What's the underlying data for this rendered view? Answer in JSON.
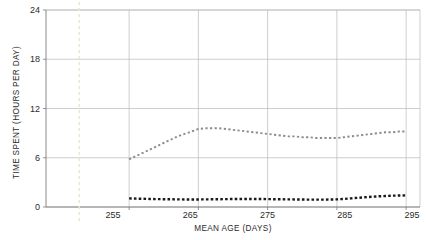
{
  "chart_data": {
    "type": "line",
    "title": "",
    "subtitle": "",
    "xlabel": "MEAN AGE (DAYS)",
    "ylabel": "TIME SPENT (HOURS PER DAY)",
    "xlim": [
      243,
      297
    ],
    "ylim": [
      0,
      24
    ],
    "xticks": [
      255,
      265,
      275,
      285,
      295
    ],
    "yticks": [
      0,
      6,
      12,
      18,
      24
    ],
    "grid": true,
    "legend": "none",
    "line_style": "dotted",
    "annotations": [
      {
        "name": "reference-line",
        "type": "vertical-dashed",
        "x": 247.8,
        "color": "#ece6c8"
      }
    ],
    "series": [
      {
        "name": "upper-series",
        "color": "#8c8c8c",
        "style": "dotted",
        "x": [
          255,
          256,
          257,
          258,
          259,
          260,
          261,
          262,
          263,
          264,
          265,
          266,
          267,
          268,
          269,
          270,
          271,
          272,
          273,
          274,
          275,
          276,
          277,
          278,
          279,
          280,
          281,
          282,
          283,
          284,
          285,
          286,
          287,
          288,
          289,
          290,
          291,
          292,
          293,
          294,
          295
        ],
        "values": [
          5.8,
          6.2,
          6.6,
          7.0,
          7.4,
          7.8,
          8.2,
          8.6,
          8.9,
          9.2,
          9.5,
          9.6,
          9.6,
          9.6,
          9.5,
          9.4,
          9.3,
          9.2,
          9.1,
          9.0,
          8.9,
          8.8,
          8.7,
          8.6,
          8.6,
          8.5,
          8.5,
          8.4,
          8.4,
          8.4,
          8.4,
          8.5,
          8.6,
          8.7,
          8.8,
          8.9,
          9.0,
          9.1,
          9.1,
          9.2,
          9.2
        ]
      },
      {
        "name": "lower-series",
        "color": "#1a1a1a",
        "style": "dotted",
        "x": [
          255,
          256,
          257,
          258,
          259,
          260,
          261,
          262,
          263,
          264,
          265,
          266,
          267,
          268,
          269,
          270,
          271,
          272,
          273,
          274,
          275,
          276,
          277,
          278,
          279,
          280,
          281,
          282,
          283,
          284,
          285,
          286,
          287,
          288,
          289,
          290,
          291,
          292,
          293,
          294,
          295
        ],
        "values": [
          1.05,
          1.02,
          1.0,
          0.98,
          0.96,
          0.95,
          0.94,
          0.93,
          0.92,
          0.92,
          0.92,
          0.93,
          0.94,
          0.95,
          0.96,
          0.97,
          0.98,
          0.98,
          0.98,
          0.97,
          0.96,
          0.95,
          0.94,
          0.93,
          0.92,
          0.91,
          0.9,
          0.9,
          0.9,
          0.91,
          0.93,
          0.98,
          1.05,
          1.12,
          1.18,
          1.24,
          1.3,
          1.34,
          1.38,
          1.4,
          1.42
        ]
      }
    ]
  },
  "axis": {
    "y_tick_labels": [
      "0",
      "6",
      "12",
      "18",
      "24"
    ],
    "x_tick_labels": [
      "255",
      "265",
      "275",
      "285",
      "295"
    ]
  }
}
